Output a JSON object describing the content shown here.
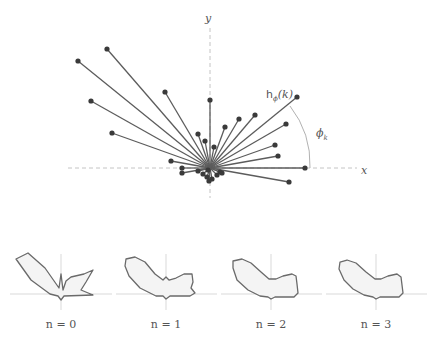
{
  "main_plot": {
    "axis_labels": {
      "x": "x",
      "y": "y"
    },
    "annotation_h": "h",
    "annotation_h_sub": "ϕ",
    "annotation_h_arg": "(k)",
    "annotation_phi": "ϕ",
    "annotation_phi_sub": "k",
    "origin": [
      210,
      168
    ],
    "endpoints": [
      [
        107,
        49
      ],
      [
        78,
        61
      ],
      [
        91,
        101
      ],
      [
        112,
        133
      ],
      [
        165,
        92
      ],
      [
        171,
        161
      ],
      [
        182,
        168
      ],
      [
        182,
        173
      ],
      [
        198,
        134
      ],
      [
        205,
        141
      ],
      [
        214,
        147
      ],
      [
        210,
        100
      ],
      [
        225,
        127
      ],
      [
        239,
        119
      ],
      [
        255,
        115
      ],
      [
        297,
        97
      ],
      [
        286,
        124
      ],
      [
        275,
        145
      ],
      [
        278,
        156
      ],
      [
        305,
        168
      ],
      [
        289,
        182
      ],
      [
        198,
        171
      ],
      [
        203,
        174
      ],
      [
        207,
        177
      ],
      [
        209,
        181
      ],
      [
        212,
        179
      ],
      [
        217,
        175
      ],
      [
        220,
        172
      ],
      [
        222,
        173
      ],
      [
        208,
        170
      ]
    ]
  },
  "subplots": [
    {
      "label": "n = 0",
      "n": 0
    },
    {
      "label": "n = 1",
      "n": 1
    },
    {
      "label": "n = 2",
      "n": 2
    },
    {
      "label": "n = 3",
      "n": 3
    }
  ],
  "colors": {
    "ray": "#5c5c5c",
    "point": "#3a3a3a",
    "shape_fill": "#f4f4f4",
    "shape_stroke": "#6a6a6a",
    "axis": "#b5b5b5"
  }
}
